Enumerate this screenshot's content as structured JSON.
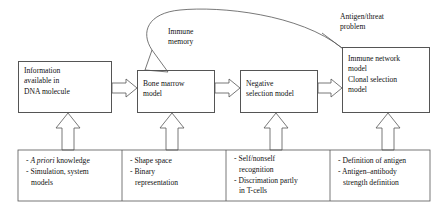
{
  "diagram": {
    "stages": [
      {
        "id": "information-dna",
        "lines": [
          "Information",
          "available in",
          "DNA molecule"
        ]
      },
      {
        "id": "bone-marrow",
        "lines": [
          "Bone marrow",
          "model"
        ]
      },
      {
        "id": "negative-selection",
        "lines": [
          "Negative",
          "selection model"
        ]
      },
      {
        "id": "immune-network-clonal",
        "groups": [
          [
            "Immune network",
            "model"
          ],
          [
            "Clonal selection",
            "model"
          ]
        ]
      }
    ],
    "labels": {
      "feedback": [
        "Immune",
        "memory"
      ],
      "antigen": [
        "Antigen/threat",
        "problem"
      ]
    },
    "details": [
      {
        "id": "detail-dna",
        "items": [
          {
            "bullet": "- ",
            "italic": "A priori",
            "rest": " knowledge",
            "cont": []
          },
          {
            "bullet": "- ",
            "italic": "",
            "rest": "Simulation, system",
            "cont": [
              "models"
            ]
          }
        ]
      },
      {
        "id": "detail-bone-marrow",
        "items": [
          {
            "bullet": "- ",
            "italic": "",
            "rest": "Shape space",
            "cont": []
          },
          {
            "bullet": "- ",
            "italic": "",
            "rest": "Binary",
            "cont": [
              "representation"
            ]
          }
        ]
      },
      {
        "id": "detail-negative-selection",
        "items": [
          {
            "bullet": "- ",
            "italic": "",
            "rest": "Self/nonself",
            "cont": [
              "recognition"
            ]
          },
          {
            "bullet": "- ",
            "italic": "",
            "rest": "Discrimation partly",
            "cont": [
              "in T-cells"
            ]
          }
        ]
      },
      {
        "id": "detail-immune-network",
        "items": [
          {
            "bullet": "- ",
            "italic": "",
            "rest": "Definition of antigen",
            "cont": []
          },
          {
            "bullet": "- ",
            "italic": "",
            "rest": "Antigen–antibody",
            "cont": [
              "strength definition"
            ]
          }
        ]
      }
    ],
    "colors": {
      "stroke": "#555555",
      "text": "#111111",
      "background": "#ffffff"
    }
  }
}
